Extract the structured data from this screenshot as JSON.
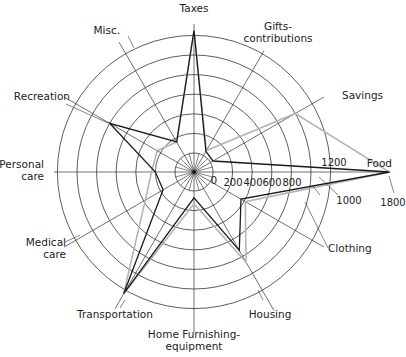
{
  "chart_data": {
    "type": "radar",
    "title": "",
    "axes": [
      "Taxes",
      "Gifts-contributions",
      "Savings",
      "Food",
      "Clothing",
      "Housing",
      "Home Furnishing-equipment",
      "Transportation",
      "Medical care",
      "Personal care",
      "Recreation",
      "Misc."
    ],
    "axis_labels": [
      {
        "lines": [
          "Taxes"
        ]
      },
      {
        "lines": [
          "Gifts-",
          "contributions"
        ]
      },
      {
        "lines": [
          "Savings"
        ]
      },
      {
        "lines": [
          "Food"
        ]
      },
      {
        "lines": [
          "Clothing"
        ]
      },
      {
        "lines": [
          "Housing"
        ]
      },
      {
        "lines": [
          "Home Furnishing-",
          "equipment"
        ]
      },
      {
        "lines": [
          "Transportation"
        ]
      },
      {
        "lines": [
          "Medical",
          "care"
        ]
      },
      {
        "lines": [
          "Personal",
          "care"
        ]
      },
      {
        "lines": [
          "Recreation"
        ]
      },
      {
        "lines": [
          "Misc."
        ]
      }
    ],
    "ring_ticks": [
      "0",
      "200",
      "400",
      "600",
      "800",
      "1000",
      "1200"
    ],
    "outer_tick": "1800",
    "range": [
      0,
      1800
    ],
    "series": [
      {
        "name": "Series A (black)",
        "color": "#1a1a1a",
        "values": [
          1250,
          50,
          30,
          1800,
          360,
          730,
          70,
          1240,
          170,
          200,
          800,
          160
        ]
      },
      {
        "name": "Series B (gray)",
        "color": "#b5b5b5",
        "values": [
          1250,
          60,
          1000,
          1800,
          410,
          870,
          130,
          1240,
          380,
          240,
          240,
          160
        ]
      }
    ],
    "grid": true,
    "legend": "none"
  },
  "colors": {
    "grid": "#333333",
    "series_black": "#1a1a1a",
    "series_gray": "#b5b5b5"
  }
}
